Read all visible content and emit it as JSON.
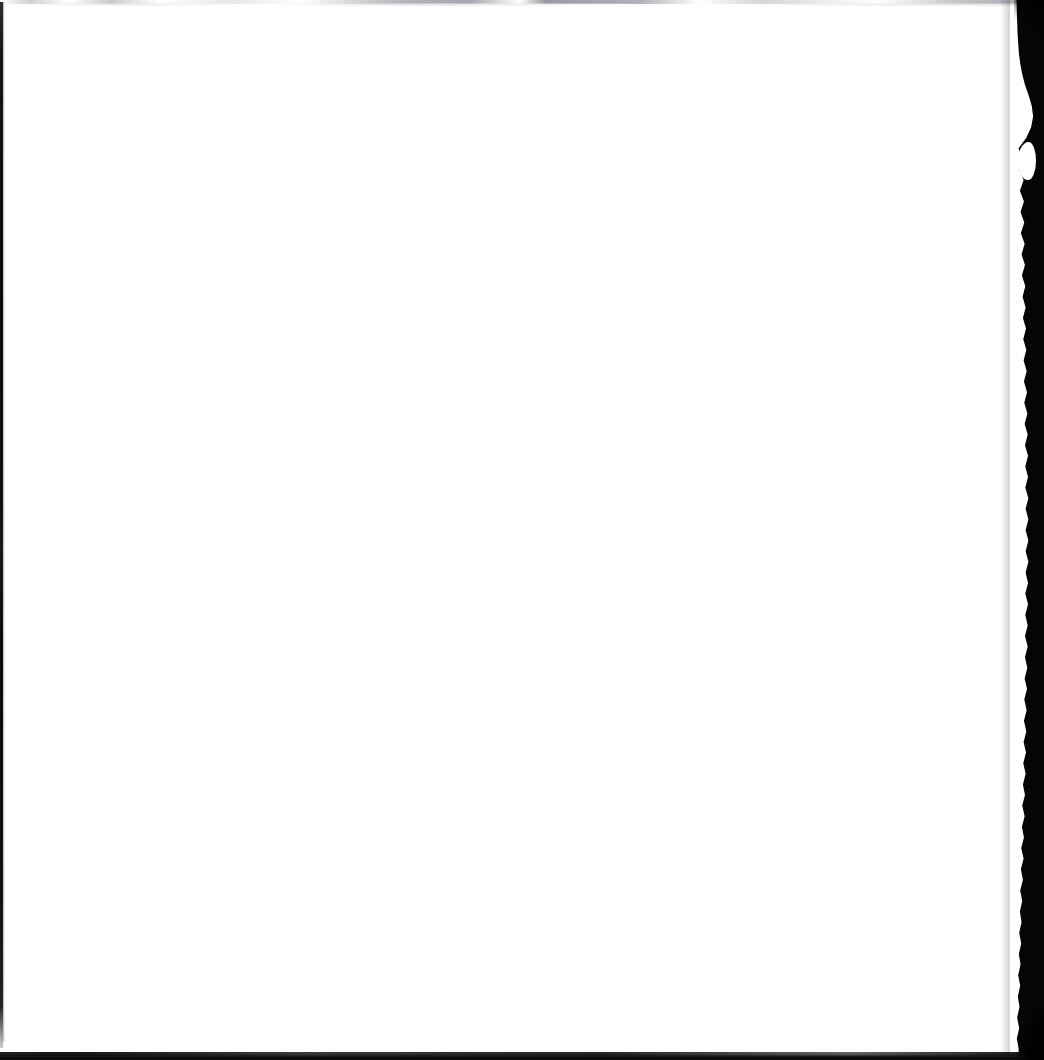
{
  "document": {
    "kind": "scanned-page",
    "page_content": "",
    "caption": ""
  },
  "canvas": {
    "width": 1044,
    "height": 1060,
    "background_color": "#ffffff"
  },
  "scan_artifacts": {
    "left_edge": {
      "name": "left-edge-line",
      "color": "#0b0b0b",
      "thickness_px": 3
    },
    "top_edge": {
      "name": "top-smudge-band",
      "color": "#b4b4ba",
      "thickness_px": 4
    },
    "right_edge": {
      "name": "right-edge-shadow",
      "color": "#050505",
      "max_thickness_px": 34
    },
    "bottom_edge": {
      "name": "bottom-edge-line",
      "color": "#0d0d0d",
      "thickness_px": 7
    }
  }
}
